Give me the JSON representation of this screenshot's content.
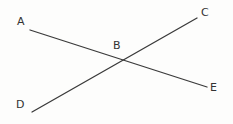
{
  "diagram": {
    "type": "line-intersection",
    "background_color": "#fdfdfc",
    "stroke_color": "#3a3a3a",
    "label_color": "#333333",
    "canvas": {
      "width": 233,
      "height": 124
    },
    "segments": [
      {
        "id": "segment-ae",
        "from_label": "A",
        "to_label": "E",
        "x1": 30,
        "y1": 30,
        "x2": 207,
        "y2": 87
      },
      {
        "id": "segment-dc",
        "from_label": "D",
        "to_label": "C",
        "x1": 32,
        "y1": 112,
        "x2": 197,
        "y2": 18
      }
    ],
    "intersection": {
      "label": "B",
      "x": 120,
      "y": 61
    },
    "labels": [
      {
        "id": "label-a",
        "text": "A",
        "x": 17,
        "y": 16
      },
      {
        "id": "label-b",
        "text": "B",
        "x": 113,
        "y": 40
      },
      {
        "id": "label-c",
        "text": "C",
        "x": 201,
        "y": 7
      },
      {
        "id": "label-d",
        "text": "D",
        "x": 16,
        "y": 99
      },
      {
        "id": "label-e",
        "text": "E",
        "x": 210,
        "y": 82
      }
    ]
  }
}
